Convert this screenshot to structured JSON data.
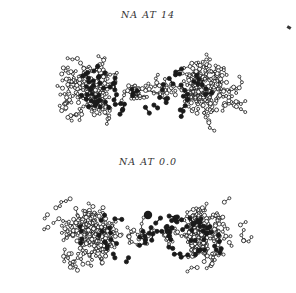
{
  "figure": {
    "panels": [
      {
        "id": "top",
        "caption": "NA AT 14",
        "center": [
          148,
          90
        ],
        "cluster_spread": [
          120,
          42
        ],
        "open_count": 210,
        "filled_count": 42,
        "filled_band": [
          85,
          215,
          70,
          112
        ],
        "seed": 14
      },
      {
        "id": "bottom",
        "caption": "NA AT 0.0",
        "center": [
          148,
          88
        ],
        "cluster_spread": [
          122,
          40
        ],
        "open_count": 220,
        "filled_count": 46,
        "filled_band": [
          80,
          220,
          70,
          112
        ],
        "seed": 3,
        "large_atom": [
          148,
          69
        ]
      }
    ],
    "colors": {
      "ink": "#1a1a1a",
      "open_fill": "#ffffff",
      "background": "#ffffff"
    },
    "legend": {
      "open_glyph": "hollow-ring-molecule",
      "filled_glyph": "solid-dot-molecule"
    }
  }
}
